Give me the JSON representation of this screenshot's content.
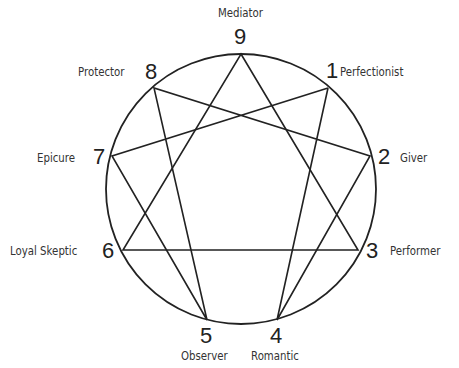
{
  "diagram": {
    "type": "enneagram",
    "circle": {
      "cx": 241,
      "cy": 189,
      "r": 135
    },
    "points": [
      {
        "n": "9",
        "name": "Mediator",
        "x": 241,
        "y": 54
      },
      {
        "n": "1",
        "name": "Perfectionist",
        "x": 328,
        "y": 88
      },
      {
        "n": "2",
        "name": "Giver",
        "x": 370,
        "y": 156
      },
      {
        "n": "3",
        "name": "Performer",
        "x": 358,
        "y": 250
      },
      {
        "n": "4",
        "name": "Romantic",
        "x": 277,
        "y": 320
      },
      {
        "n": "5",
        "name": "Observer",
        "x": 207,
        "y": 320
      },
      {
        "n": "6",
        "name": "Loyal Skeptic",
        "x": 123,
        "y": 250
      },
      {
        "n": "7",
        "name": "Epicure",
        "x": 112,
        "y": 156
      },
      {
        "n": "8",
        "name": "Protector",
        "x": 154,
        "y": 88
      }
    ],
    "triangle": [
      "9",
      "3",
      "6"
    ],
    "hexad": [
      "1",
      "4",
      "2",
      "8",
      "5",
      "7",
      "1"
    ]
  },
  "labels": {
    "n9": "9",
    "n1": "1",
    "n2": "2",
    "n3": "3",
    "n4": "4",
    "n5": "5",
    "n6": "6",
    "n7": "7",
    "n8": "8",
    "t9": "Mediator",
    "t1": "Perfectionist",
    "t2": "Giver",
    "t3": "Performer",
    "t4": "Romantic",
    "t5": "Observer",
    "t6": "Loyal Skeptic",
    "t7": "Epicure",
    "t8": "Protector"
  }
}
